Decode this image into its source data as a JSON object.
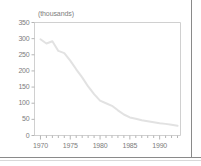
{
  "chart_data": {
    "type": "line",
    "title": "",
    "subtitle": "",
    "unit_label": "(thousands)",
    "xlabel": "",
    "ylabel": "",
    "xlim": [
      1969,
      1993.5
    ],
    "ylim": [
      0,
      350
    ],
    "grid": false,
    "legend": null,
    "yticks": [
      0,
      50,
      100,
      150,
      200,
      250,
      300,
      350
    ],
    "ytick_labels": [
      "0",
      "50",
      "100",
      "150",
      "200",
      "250",
      "300",
      "350"
    ],
    "xticks": [
      1970,
      1975,
      1980,
      1985,
      1990
    ],
    "xtick_labels": [
      "1970",
      "1975",
      "1980",
      "1985",
      "1990"
    ],
    "xminor_step": 1,
    "series": [
      {
        "name": "series-1",
        "color": "#e2e2e2",
        "x": [
          1970,
          1971,
          1972,
          1973,
          1974,
          1975,
          1976,
          1977,
          1978,
          1979,
          1980,
          1981,
          1982,
          1983,
          1984,
          1985,
          1986,
          1987,
          1988,
          1989,
          1990,
          1991,
          1992,
          1993
        ],
        "values": [
          298,
          285,
          292,
          262,
          255,
          232,
          205,
          180,
          152,
          128,
          108,
          100,
          92,
          78,
          65,
          56,
          52,
          47,
          44,
          41,
          38,
          36,
          33,
          30
        ]
      }
    ]
  },
  "axes": {
    "frame_color": "#d0d0d0",
    "tick_color": "#b5b5b5",
    "text_color": "#7d7d7d"
  }
}
